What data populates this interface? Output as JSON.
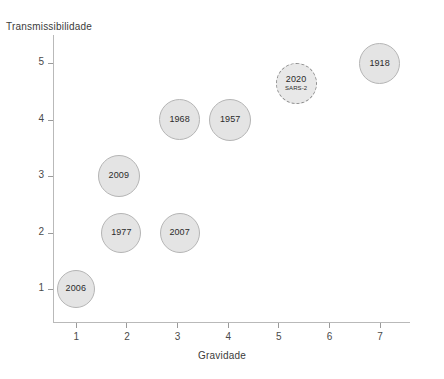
{
  "chart_data": {
    "type": "scatter",
    "title": "",
    "xlabel": "Gravidade",
    "ylabel": "Transmissibilidade",
    "xlim": [
      0.55,
      7.6
    ],
    "ylim": [
      0.4,
      5.5
    ],
    "xticks": [
      "1",
      "2",
      "3",
      "4",
      "5",
      "6",
      "7"
    ],
    "yticks": [
      "1",
      "2",
      "3",
      "4",
      "5"
    ],
    "grid": false,
    "legend": "none",
    "colors": {
      "bubble_fill": "#e4e4e4",
      "bubble_stroke": "#b5b5b5",
      "highlight_stroke": "#8e8e8e",
      "axis": "#b9b9b9",
      "text": "#2b2b2b"
    },
    "points": [
      {
        "label": "2006",
        "sublabel": "",
        "x": 1,
        "y": 1,
        "size": 38,
        "style": "solid"
      },
      {
        "label": "2009",
        "sublabel": "",
        "x": 1.85,
        "y": 3,
        "size": 42,
        "style": "solid"
      },
      {
        "label": "1977",
        "sublabel": "",
        "x": 1.9,
        "y": 2,
        "size": 40,
        "style": "solid"
      },
      {
        "label": "2007",
        "sublabel": "",
        "x": 3.05,
        "y": 2,
        "size": 40,
        "style": "solid"
      },
      {
        "label": "1968",
        "sublabel": "",
        "x": 3.05,
        "y": 4,
        "size": 41,
        "style": "solid"
      },
      {
        "label": "1957",
        "sublabel": "",
        "x": 4.05,
        "y": 4,
        "size": 42,
        "style": "solid"
      },
      {
        "label": "2020",
        "sublabel": "SARS-2",
        "x": 5.35,
        "y": 4.65,
        "size": 41,
        "style": "dashed"
      },
      {
        "label": "1918",
        "sublabel": "",
        "x": 7.0,
        "y": 5.0,
        "size": 41,
        "style": "solid"
      }
    ]
  }
}
